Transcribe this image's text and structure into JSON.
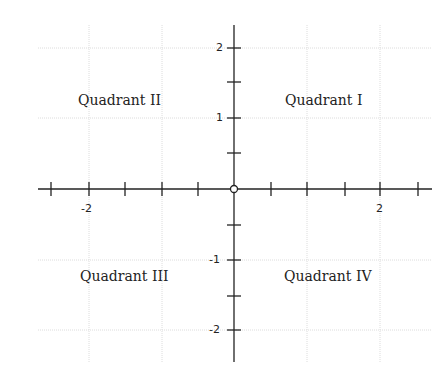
{
  "diagram": {
    "quadrants": [
      {
        "label": "Quadrant I",
        "position": "upper-right"
      },
      {
        "label": "Quadrant II",
        "position": "upper-left"
      },
      {
        "label": "Quadrant III",
        "position": "lower-left"
      },
      {
        "label": "Quadrant IV",
        "position": "lower-right"
      }
    ],
    "x_axis": {
      "tick_labels": [
        "-2",
        "2"
      ],
      "range": [
        -2.7,
        2.7
      ],
      "minor_step": 0.5
    },
    "y_axis": {
      "tick_labels": [
        "2",
        "1",
        "-1",
        "-2"
      ],
      "range": [
        -2.4,
        2.3
      ],
      "minor_step": 0.5
    },
    "origin_marker": "open-circle",
    "colors": {
      "axis": "#222222",
      "grid": "#d9d9d9",
      "text": "#222222"
    }
  }
}
